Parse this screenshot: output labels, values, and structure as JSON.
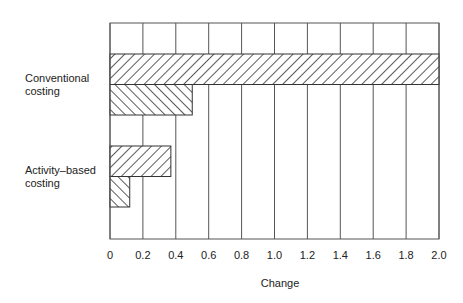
{
  "chart_data": {
    "type": "bar",
    "orientation": "horizontal",
    "title": "",
    "xlabel": "Change",
    "ylabel": "",
    "xlim": [
      0,
      2.0
    ],
    "x_ticks": [
      "0",
      "0.2",
      "0.4",
      "0.6",
      "0.8",
      "1.0",
      "1.2",
      "1.4",
      "1.6",
      "1.8",
      "2.0"
    ],
    "grid": "vertical",
    "legend": "none",
    "categories": [
      "Conventional costing",
      "Activity–based costing"
    ],
    "category_label_lines": [
      [
        "Conventional",
        "costing"
      ],
      [
        "Activity–based",
        "costing"
      ]
    ],
    "series": [
      {
        "name": "series-1 (forward hatch)",
        "pattern": "forward-diagonal",
        "values": [
          2.0,
          0.37
        ]
      },
      {
        "name": "series-2 (back hatch)",
        "pattern": "back-diagonal",
        "values": [
          0.5,
          0.12
        ]
      }
    ]
  }
}
